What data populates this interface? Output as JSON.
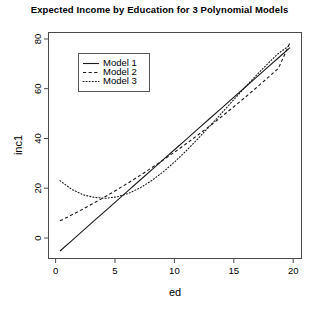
{
  "chart_data": {
    "type": "line",
    "title": "Expected Income by Education for 3 Polynomial Models",
    "xlabel": "ed",
    "ylabel": "inc1",
    "xlim": [
      -1.0,
      21.0
    ],
    "ylim": [
      -6.0,
      84.0
    ],
    "xticks": [
      0,
      5,
      10,
      15,
      20
    ],
    "yticks": [
      0,
      20,
      40,
      60,
      80
    ],
    "xtick_labels": [
      "0",
      "5",
      "10",
      "15",
      "20"
    ],
    "ytick_labels": [
      "0",
      "20",
      "40",
      "60",
      "80"
    ],
    "grid": false,
    "legend_position": "upper left",
    "x": [
      0,
      1,
      2,
      3,
      4,
      5,
      6,
      7,
      8,
      9,
      10,
      11,
      12,
      13,
      14,
      15,
      16,
      17,
      18,
      19,
      20
    ],
    "series": [
      {
        "name": "Model 1",
        "linestyle": "solid",
        "color": "#1a1a1a",
        "values": [
          -3.0,
          1.05,
          5.1,
          9.15,
          13.2,
          17.25,
          21.3,
          25.35,
          29.4,
          33.45,
          37.5,
          41.55,
          45.6,
          49.65,
          53.7,
          57.75,
          61.8,
          65.85,
          69.9,
          73.95,
          78.0
        ]
      },
      {
        "name": "Model 2",
        "linestyle": "dashed",
        "color": "#1a1a1a",
        "values": [
          9.0,
          11.3,
          13.7,
          16.2,
          18.8,
          21.5,
          24.3,
          27.2,
          30.2,
          33.3,
          36.5,
          39.8,
          43.2,
          46.7,
          50.3,
          54.0,
          57.8,
          61.7,
          65.7,
          69.8,
          80.0
        ]
      },
      {
        "name": "Model 3",
        "linestyle": "dotted",
        "color": "#1a1a1a",
        "values": [
          25.0,
          21.6,
          19.4,
          18.3,
          18.0,
          18.6,
          20.0,
          22.2,
          25.1,
          28.6,
          32.6,
          37.0,
          41.7,
          46.6,
          51.6,
          56.7,
          61.7,
          66.6,
          71.3,
          75.7,
          79.0
        ]
      }
    ],
    "legend_entries": [
      {
        "label": "Model 1",
        "linestyle": "solid"
      },
      {
        "label": "Model 2",
        "linestyle": "dashed"
      },
      {
        "label": "Model 3",
        "linestyle": "dotted"
      }
    ]
  }
}
